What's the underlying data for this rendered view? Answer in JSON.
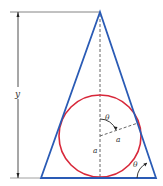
{
  "diagram": {
    "type": "geometry",
    "colors": {
      "triangle": "#2a5bb5",
      "circle": "#d8283a",
      "lines": "#444444",
      "background": "#ffffff"
    },
    "labels": {
      "height": "y",
      "angle_center": "θ",
      "radius_slant": "a",
      "radius_vertical": "a",
      "angle_base": "θ"
    }
  }
}
